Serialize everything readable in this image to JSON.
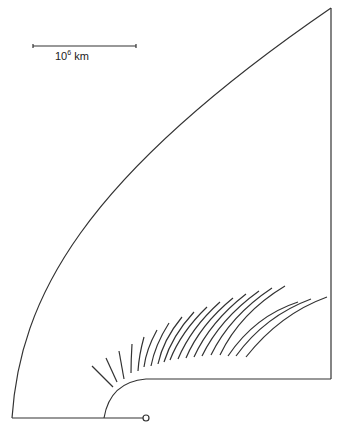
{
  "scale_bar": {
    "label_base": "10",
    "label_exp": "6",
    "label_unit": " km",
    "x1": 33,
    "x2": 136,
    "y": 46
  },
  "colors": {
    "stroke": "#333333",
    "background": "#ffffff"
  },
  "outline": {
    "outer_curve": "M12,418 C20,300 80,180 331,8",
    "right_edge": "M331,8 L331,379",
    "inner_bottom": "M331,379 L146,379 Q110,382 104,418",
    "baseline": "M12,418 L143,418",
    "origin_circle": {
      "cx": 146,
      "cy": 418,
      "r": 3
    }
  },
  "field_lines": [
    "M92,366 L113,387",
    "M106,358 L117,382",
    "M119,351 L124,379",
    "M132,344 Q131,360 131,373",
    "M144,337 Q139,355 138,371",
    "M157,330 Q146,350 144,367",
    "M169,323 Q155,345 151,366",
    "M182,317 Q163,340 158,364",
    "M194,312 Q172,336 164,362",
    "M207,307 Q181,332 170,360",
    "M220,302 Q191,328 178,359",
    "M233,298 Q200,325 186,358",
    "M246,294 Q210,322 194,357",
    "M259,291 Q220,319 202,356",
    "M272,288 Q230,316 211,355",
    "M285,286 Q240,313 220,355",
    "M298,302 Q255,316 228,356",
    "M311,299 Q265,316 236,356",
    "M327,297 Q280,314 246,357"
  ]
}
